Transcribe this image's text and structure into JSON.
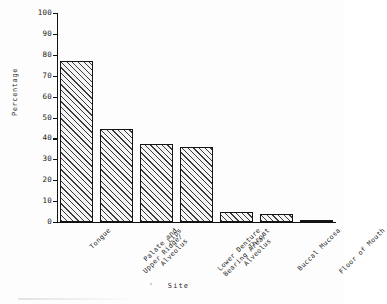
{
  "chart_data": {
    "type": "bar",
    "title": "",
    "xlabel": "Site",
    "ylabel": "Percentage",
    "categories": [
      "Tongue",
      "Palate and\nUpper Ridge/\nAlveolus",
      "Lips",
      "Lower Denture\nBearing Area/\nAlveolus",
      "Throat",
      "Buccal Mucosa",
      "Floor of Mouth"
    ],
    "values": [
      77,
      44.5,
      37.5,
      36,
      5,
      4,
      0.5
    ],
    "ylim": [
      0,
      100
    ],
    "yticks": [
      0,
      10,
      20,
      30,
      40,
      50,
      60,
      70,
      80,
      90,
      100
    ],
    "ytick_labels": [
      "0",
      "10",
      "20",
      "30",
      "40",
      "50",
      "60",
      "70",
      "80",
      "90",
      "100"
    ],
    "grid": false,
    "legend": false,
    "bar_fill": "diagonal-hatch",
    "colors": {
      "bar_edge": "#141414",
      "bar_hatch": "#3a3a3a",
      "bar_face": "#f4f4f4",
      "axis": "#111111",
      "text": "#1a1a1a",
      "background": "#fdfdfd"
    }
  }
}
